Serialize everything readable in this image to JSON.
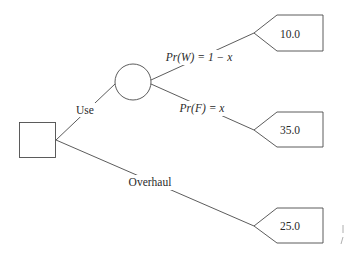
{
  "diagram": {
    "type": "decision-tree",
    "decision_node": {
      "shape": "square",
      "label": ""
    },
    "chance_node": {
      "shape": "circle",
      "label": ""
    },
    "branches": {
      "use": {
        "label": "Use"
      },
      "overhaul": {
        "label": "Overhaul"
      },
      "works": {
        "label": "Pr(W) = 1 − x",
        "prob_name": "Pr",
        "event": "W",
        "expr": "1 − x"
      },
      "fails": {
        "label": "Pr(F) = x",
        "prob_name": "Pr",
        "event": "F",
        "expr": "x"
      }
    },
    "outcomes": [
      {
        "id": "works-outcome",
        "value": "10.0"
      },
      {
        "id": "fails-outcome",
        "value": "35.0"
      },
      {
        "id": "overhaul-outcome",
        "value": "25.0"
      }
    ],
    "colors": {
      "line": "#4a4a4a",
      "text": "#2a2a2a",
      "background": "#ffffff"
    }
  }
}
